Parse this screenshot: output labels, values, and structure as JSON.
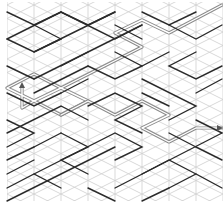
{
  "maze": {
    "type": "rhombic-maze",
    "width": 223,
    "height": 207,
    "grid": {
      "origin_x": 7,
      "origin_y": 5,
      "col_step": 27,
      "row_step": 13.5,
      "cols": 9,
      "rows": 15,
      "color": "#cfcfcf"
    },
    "colors": {
      "wall": "#2b2b2b",
      "path": "#8a8a8a",
      "marker": "#555555",
      "background": "#ffffff"
    },
    "walls": [
      [
        [
          7,
          12
        ],
        [
          34,
          25
        ],
        [
          61,
          12
        ],
        [
          88,
          25
        ],
        [
          115,
          12
        ]
      ],
      [
        [
          7,
          39
        ],
        [
          34,
          52
        ],
        [
          61,
          39
        ]
      ],
      [
        [
          7,
          66
        ],
        [
          34,
          79
        ]
      ],
      [
        [
          7,
          93
        ],
        [
          34,
          106
        ],
        [
          61,
          93
        ]
      ],
      [
        [
          7,
          120
        ],
        [
          34,
          133
        ],
        [
          7,
          147
        ]
      ],
      [
        [
          7,
          160
        ],
        [
          34,
          147
        ]
      ],
      [
        [
          7,
          188
        ],
        [
          34,
          174
        ],
        [
          61,
          188
        ]
      ],
      [
        [
          34,
          25
        ],
        [
          61,
          39
        ]
      ],
      [
        [
          61,
          12
        ],
        [
          115,
          39
        ],
        [
          142,
          25
        ]
      ],
      [
        [
          7,
          39
        ],
        [
          61,
          12
        ]
      ],
      [
        [
          34,
          52
        ],
        [
          115,
          12
        ]
      ],
      [
        [
          34,
          79
        ],
        [
          142,
          25
        ]
      ],
      [
        [
          142,
          12
        ],
        [
          169,
          25
        ],
        [
          196,
          12
        ]
      ],
      [
        [
          169,
          25
        ],
        [
          196,
          39
        ],
        [
          222,
          25
        ]
      ],
      [
        [
          115,
          52
        ],
        [
          142,
          66
        ],
        [
          169,
          52
        ]
      ],
      [
        [
          196,
          52
        ],
        [
          169,
          66
        ],
        [
          196,
          79
        ],
        [
          222,
          66
        ]
      ],
      [
        [
          88,
          66
        ],
        [
          115,
          79
        ],
        [
          142,
          66
        ]
      ],
      [
        [
          34,
          93
        ],
        [
          88,
          66
        ]
      ],
      [
        [
          61,
          93
        ],
        [
          88,
          79
        ]
      ],
      [
        [
          88,
          106
        ],
        [
          115,
          93
        ],
        [
          142,
          106
        ],
        [
          115,
          120
        ],
        [
          142,
          133
        ]
      ],
      [
        [
          142,
          79
        ],
        [
          196,
          106
        ],
        [
          169,
          120
        ]
      ],
      [
        [
          142,
          93
        ],
        [
          169,
          106
        ]
      ],
      [
        [
          196,
          120
        ],
        [
          222,
          133
        ]
      ],
      [
        [
          7,
          133
        ],
        [
          61,
          106
        ],
        [
          88,
          120
        ]
      ],
      [
        [
          61,
          133
        ],
        [
          88,
          147
        ],
        [
          61,
          160
        ],
        [
          88,
          174
        ]
      ],
      [
        [
          34,
          147
        ],
        [
          61,
          133
        ]
      ],
      [
        [
          34,
          174
        ],
        [
          115,
          133
        ],
        [
          142,
          147
        ],
        [
          115,
          160
        ]
      ],
      [
        [
          7,
          201
        ],
        [
          115,
          147
        ]
      ],
      [
        [
          88,
          188
        ],
        [
          115,
          201
        ]
      ],
      [
        [
          142,
          174
        ],
        [
          169,
          160
        ],
        [
          196,
          174
        ]
      ],
      [
        [
          115,
          188
        ],
        [
          222,
          133
        ]
      ],
      [
        [
          169,
          188
        ],
        [
          196,
          174
        ],
        [
          222,
          188
        ]
      ],
      [
        [
          142,
          201
        ],
        [
          169,
          188
        ]
      ],
      [
        [
          196,
          147
        ],
        [
          222,
          160
        ]
      ],
      [
        [
          169,
          133
        ],
        [
          196,
          147
        ]
      ],
      [
        [
          7,
          174
        ],
        [
          34,
          160
        ]
      ],
      [
        [
          61,
          66
        ],
        [
          88,
          52
        ]
      ],
      [
        [
          115,
          25
        ],
        [
          142,
          39
        ]
      ],
      [
        [
          196,
          93
        ],
        [
          222,
          79
        ]
      ]
    ],
    "solution_path": [
      [
        222,
        5
      ],
      [
        169,
        33
      ],
      [
        142,
        20
      ],
      [
        115,
        33
      ],
      [
        142,
        47
      ],
      [
        61,
        88
      ],
      [
        34,
        74
      ],
      [
        7,
        88
      ],
      [
        34,
        101
      ],
      [
        61,
        88
      ],
      [
        88,
        101
      ],
      [
        61,
        115
      ],
      [
        34,
        101
      ],
      [
        22,
        108
      ],
      [
        22,
        88
      ]
    ],
    "solution_path_2": [
      [
        61,
        115
      ],
      [
        88,
        101
      ],
      [
        115,
        115
      ],
      [
        142,
        101
      ],
      [
        169,
        115
      ],
      [
        142,
        128
      ],
      [
        169,
        142
      ],
      [
        196,
        128
      ],
      [
        222,
        128
      ]
    ],
    "markers": [
      {
        "name": "start-arrow",
        "x": 22,
        "y": 86,
        "direction": "up"
      },
      {
        "name": "end-arrow",
        "x": 220,
        "y": 128,
        "direction": "right"
      }
    ]
  }
}
